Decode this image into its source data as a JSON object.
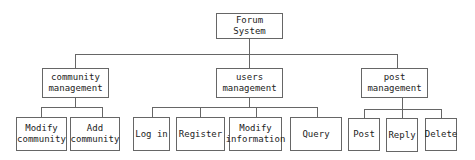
{
  "diagram": {
    "type": "hierarchy",
    "root": {
      "label": "Forum System"
    },
    "groups": [
      {
        "label": "community\nmanagement",
        "children": [
          "Modify\ncommunity",
          "Add\ncommunity"
        ]
      },
      {
        "label": "users\nmanagement",
        "children": [
          "Log in",
          "Register",
          "Modify\ninformation",
          "Query"
        ]
      },
      {
        "label": "post\nmanagement",
        "children": [
          "Post",
          "Reply",
          "Delete"
        ]
      }
    ]
  },
  "colors": {
    "line": "#666666",
    "text": "#222222",
    "background": "#ffffff"
  }
}
